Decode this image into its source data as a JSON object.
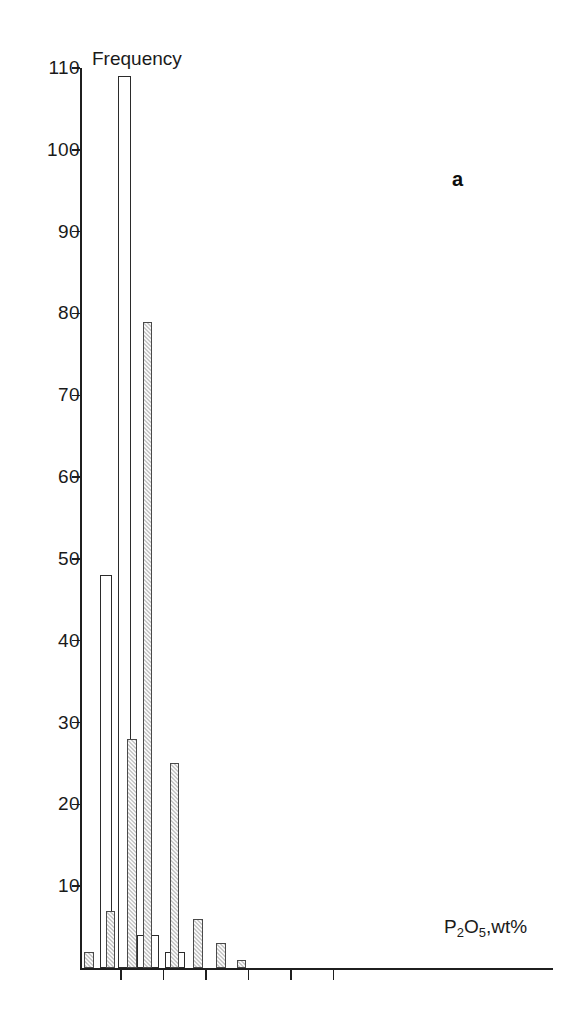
{
  "chart_data": {
    "type": "bar",
    "title": "",
    "panel_label": "a",
    "xlabel": "P2O5,wt%",
    "xlabel_parts": {
      "pre": "P",
      "sub1": "2",
      "mid": "O",
      "sub2": "5",
      "post": ",wt%"
    },
    "ylabel": "Frequency",
    "ylim": [
      0,
      110
    ],
    "yticks": [
      10,
      20,
      30,
      40,
      50,
      60,
      70,
      80,
      90,
      100,
      110
    ],
    "ytick_labels": [
      "10",
      "20",
      "30",
      "40",
      "50",
      "60",
      "70",
      "80",
      "90",
      "100",
      "110"
    ],
    "grid": false,
    "legend": "none",
    "xtick_count": 6,
    "xtick_labels": [
      "",
      "",
      "",
      "",
      "",
      ""
    ],
    "xtick_positions": [
      0.085,
      0.175,
      0.265,
      0.355,
      0.445,
      0.535
    ],
    "series": [
      {
        "name": "open",
        "style": "outline-white",
        "color": "#ffffff",
        "edge_color": "#2b2b2b",
        "bars": [
          {
            "x": 0.0425,
            "width": 0.026,
            "value": 48
          },
          {
            "x": 0.081,
            "width": 0.026,
            "value": 109
          },
          {
            "x": 0.1215,
            "width": 0.026,
            "value": 4
          },
          {
            "x": 0.14,
            "width": 0.026,
            "value": 4
          },
          {
            "x": 0.18,
            "width": 0.022,
            "value": 2
          },
          {
            "x": 0.201,
            "width": 0.022,
            "value": 2
          }
        ]
      },
      {
        "name": "hatched",
        "style": "hatched-grey",
        "color": "#c9c9c9",
        "edge_color": "#4a4a4a",
        "bars": [
          {
            "x": 0.009,
            "width": 0.02,
            "value": 2
          },
          {
            "x": 0.054,
            "width": 0.02,
            "value": 7
          },
          {
            "x": 0.1,
            "width": 0.02,
            "value": 28
          },
          {
            "x": 0.133,
            "width": 0.02,
            "value": 79
          },
          {
            "x": 0.19,
            "width": 0.02,
            "value": 25
          },
          {
            "x": 0.239,
            "width": 0.02,
            "value": 6
          },
          {
            "x": 0.288,
            "width": 0.02,
            "value": 3
          },
          {
            "x": 0.331,
            "width": 0.02,
            "value": 1
          }
        ]
      }
    ]
  }
}
